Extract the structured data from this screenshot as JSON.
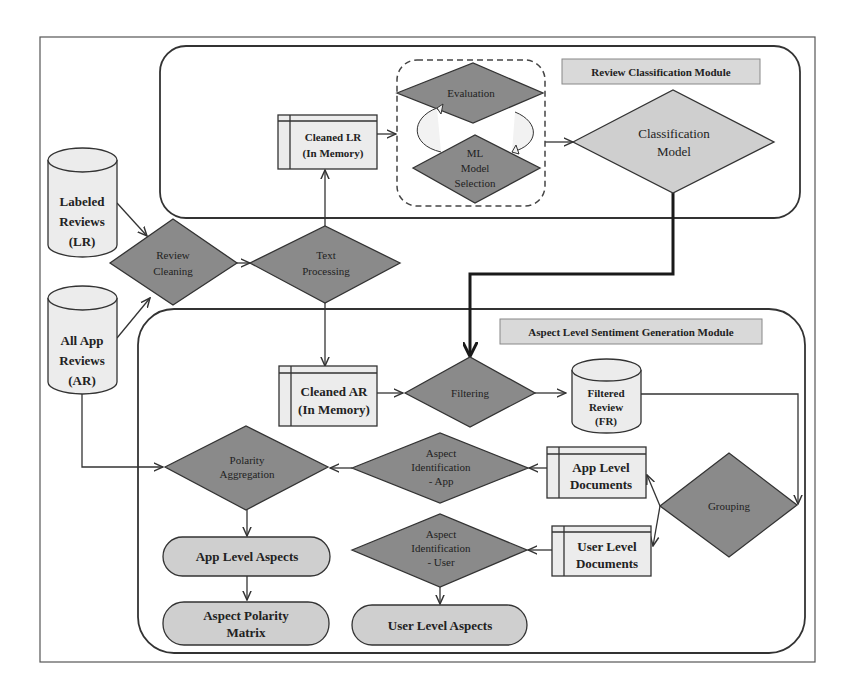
{
  "diagram": {
    "colors": {
      "dark_diamond": "#8a8a8a",
      "light_shape": "#cfcfcf",
      "storage_fill": "#ececec",
      "title_box": "#d9d9d9",
      "stroke": "#333333"
    },
    "modules": {
      "classification": {
        "title": "Review Classification Module"
      },
      "sentiment": {
        "title": "Aspect Level Sentiment Generation Module"
      }
    },
    "data_stores": {
      "labeled_reviews": [
        "Labeled",
        "Reviews",
        "(LR)"
      ],
      "all_app_reviews": [
        "All App",
        "Reviews",
        "(AR)"
      ],
      "filtered_review": [
        "Filtered",
        "Review",
        "(FR)"
      ]
    },
    "memory_stores": {
      "cleaned_lr": [
        "Cleaned LR",
        "(In Memory)"
      ],
      "cleaned_ar": [
        "Cleaned AR",
        "(In Memory)"
      ],
      "app_level_documents": [
        "App Level",
        "Documents"
      ],
      "user_level_documents": [
        "User Level",
        "Documents"
      ]
    },
    "processes": {
      "review_cleaning": [
        "Review",
        "Cleaning"
      ],
      "text_processing": [
        "Text",
        "Processing"
      ],
      "evaluation": [
        "Evaluation"
      ],
      "ml_model_selection": [
        "ML",
        "Model",
        "Selection"
      ],
      "classification_model": [
        "Classification",
        "Model"
      ],
      "filtering": [
        "Filtering"
      ],
      "grouping": [
        "Grouping"
      ],
      "aspect_identification_app": [
        "Aspect",
        "Identification",
        "- App"
      ],
      "aspect_identification_user": [
        "Aspect",
        "Identification",
        "- User"
      ],
      "polarity_aggregation": [
        "Polarity",
        "Aggregation"
      ]
    },
    "outputs": {
      "app_level_aspects": [
        "App Level Aspects"
      ],
      "aspect_polarity_matrix": [
        "Aspect Polarity",
        "Matrix"
      ],
      "user_level_aspects": [
        "User Level Aspects"
      ]
    }
  }
}
